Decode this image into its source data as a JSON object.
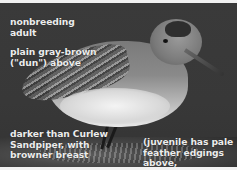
{
  "image": {
    "subject": "nonbreeding adult sandpiper (dunlin) on rock",
    "background_color": "#383838",
    "text_color": "#ececec"
  },
  "annotations": [
    {
      "id": "plumage-age",
      "text": "nonbreeding\nadult"
    },
    {
      "id": "upperparts",
      "text": "plain gray-brown\n(\"dun\") above"
    },
    {
      "id": "comparison",
      "text": "darker than Curlew\nSandpiper, with\nbrowner breast"
    },
    {
      "id": "juvenile-note",
      "text": "(juvenile has pale\nfeather edgings above,\nstippling below)"
    }
  ]
}
